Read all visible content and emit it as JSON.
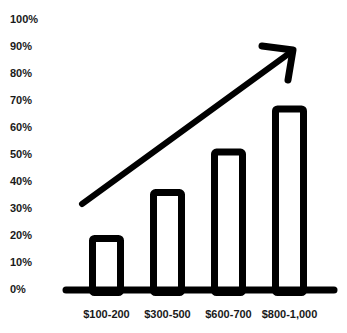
{
  "chart_data": {
    "type": "bar",
    "title": "",
    "xlabel": "",
    "ylabel": "",
    "categories": [
      "$100-200",
      "$300-500",
      "$600-700",
      "$800-1,000"
    ],
    "values": [
      20,
      37,
      52,
      68
    ],
    "value_unit": "%",
    "ylim": [
      0,
      100
    ],
    "yticks": [
      "0%",
      "10%",
      "20%",
      "30%",
      "40%",
      "50%",
      "60%",
      "70%",
      "80%",
      "90%",
      "100%"
    ],
    "grid": false,
    "legend": null,
    "annotations": [
      {
        "type": "arrow",
        "direction": "up-right",
        "meaning": "increasing trend",
        "from_pct": 33,
        "to_pct": 88
      }
    ],
    "style": {
      "bar_fill": "#ffffff",
      "bar_outline": "#000000",
      "axis_color": "#000000",
      "arrow_color": "#000000"
    }
  }
}
